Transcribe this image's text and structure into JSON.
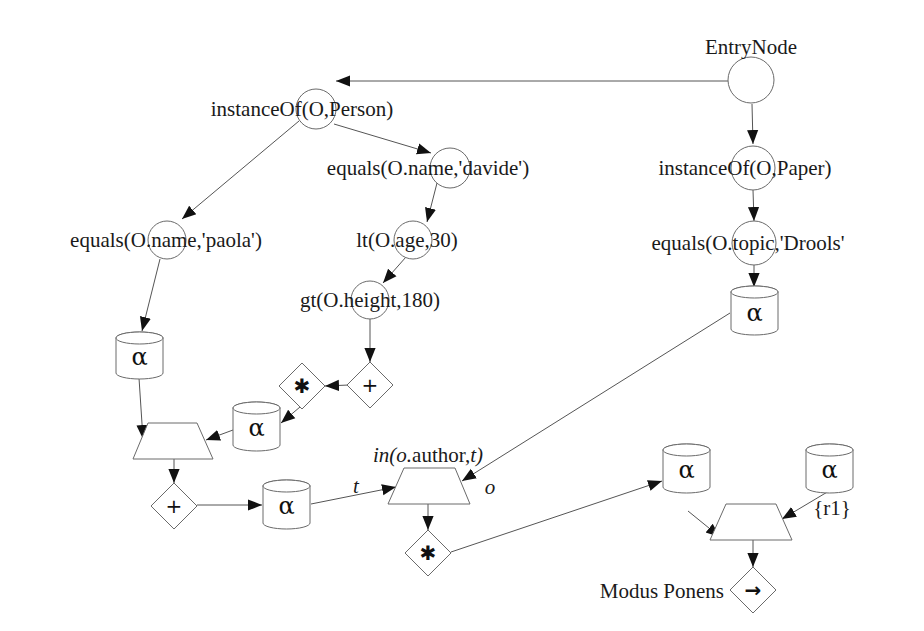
{
  "diagram": {
    "colors": {
      "background": "#ffffff",
      "stroke": "#6a6a6a",
      "text": "#1a1a1a",
      "arrowhead": "#111111"
    },
    "nodes": {
      "entry": {
        "label": "EntryNode",
        "shape": "circle"
      },
      "instanceof_person": {
        "label": "instanceOf(O,Person)",
        "shape": "circle"
      },
      "equals_davide": {
        "label": "equals(O.name,'davide')",
        "shape": "circle"
      },
      "instanceof_paper": {
        "label": "instanceOf(O,Paper)",
        "shape": "circle"
      },
      "equals_paola": {
        "label": "equals(O.name,'paola')",
        "shape": "circle"
      },
      "lt_age": {
        "label": "lt(O.age,30)",
        "shape": "circle"
      },
      "equals_drools": {
        "label": "equals(O.topic,'Drools'",
        "shape": "circle"
      },
      "gt_height": {
        "label": "gt(O.height,180)",
        "shape": "circle"
      },
      "alpha_paola": {
        "symbol": "α",
        "shape": "cylinder"
      },
      "alpha_drools": {
        "symbol": "α",
        "shape": "cylinder"
      },
      "plus_height": {
        "symbol": "+",
        "shape": "diamond"
      },
      "star_height": {
        "symbol": "✱",
        "shape": "diamond"
      },
      "alpha_mid": {
        "symbol": "α",
        "shape": "cylinder"
      },
      "join_left": {
        "shape": "trapezoid"
      },
      "plus_join": {
        "symbol": "+",
        "shape": "diamond"
      },
      "alpha_bottom": {
        "symbol": "α",
        "shape": "cylinder"
      },
      "join_author": {
        "label": "in(o.author,t)",
        "shape": "trapezoid",
        "input_left": "t",
        "input_right": "o"
      },
      "star_join": {
        "symbol": "✱",
        "shape": "diamond"
      },
      "alpha_right": {
        "symbol": "α",
        "shape": "cylinder"
      },
      "alpha_r1": {
        "symbol": "α",
        "shape": "cylinder",
        "label": "{r1}"
      },
      "join_final": {
        "shape": "trapezoid"
      },
      "modus_ponens": {
        "label": "Modus Ponens",
        "symbol": "→",
        "shape": "diamond"
      }
    },
    "edges": [
      [
        "entry",
        "instanceof_person"
      ],
      [
        "entry",
        "instanceof_paper"
      ],
      [
        "instanceof_person",
        "equals_davide"
      ],
      [
        "instanceof_person",
        "equals_paola"
      ],
      [
        "equals_davide",
        "lt_age"
      ],
      [
        "lt_age",
        "gt_height"
      ],
      [
        "gt_height",
        "plus_height"
      ],
      [
        "plus_height",
        "star_height"
      ],
      [
        "star_height",
        "alpha_mid"
      ],
      [
        "alpha_mid",
        "join_left"
      ],
      [
        "equals_paola",
        "alpha_paola"
      ],
      [
        "alpha_paola",
        "join_left"
      ],
      [
        "join_left",
        "plus_join"
      ],
      [
        "plus_join",
        "alpha_bottom"
      ],
      [
        "alpha_bottom",
        "join_author"
      ],
      [
        "instanceof_paper",
        "equals_drools"
      ],
      [
        "equals_drools",
        "alpha_drools"
      ],
      [
        "alpha_drools",
        "join_author"
      ],
      [
        "join_author",
        "star_join"
      ],
      [
        "star_join",
        "alpha_right"
      ],
      [
        "alpha_right",
        "join_final"
      ],
      [
        "alpha_r1",
        "join_final"
      ],
      [
        "join_final",
        "modus_ponens"
      ]
    ]
  }
}
